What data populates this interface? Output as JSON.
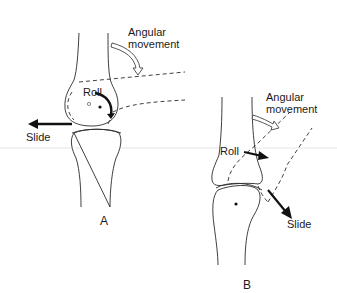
{
  "figure": {
    "panel_a": {
      "label": "A",
      "annotations": {
        "angular": "Angular",
        "movement": "movement",
        "roll": "Roll",
        "slide": "Slide"
      }
    },
    "panel_b": {
      "label": "B",
      "annotations": {
        "angular": "Angular",
        "movement": "movement",
        "roll": "Roll",
        "slide": "Slide"
      }
    }
  },
  "colors": {
    "line": "#2a2a2a",
    "background": "#ffffff",
    "separator": "#e6e6e6"
  }
}
